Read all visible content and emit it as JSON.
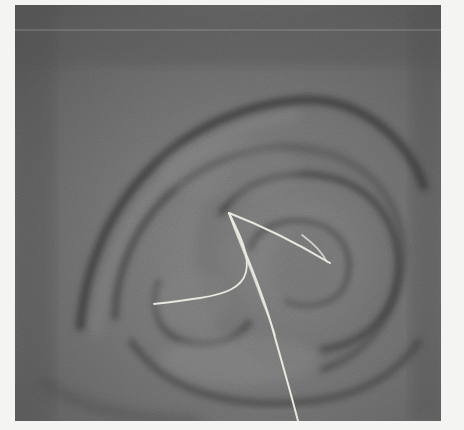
{
  "figure": {
    "colors": {
      "background": "#f4f4f2",
      "tissue_base": "#707070",
      "tissue_light": "#8a8a8a",
      "fold_shadow": "#3e3e3e",
      "path_color": "#e6e6dc"
    },
    "paths": [
      {
        "name": "main-down",
        "points": [
          [
            229,
            213
          ],
          [
            245,
            250
          ],
          [
            262,
            290
          ],
          [
            275,
            330
          ],
          [
            288,
            380
          ],
          [
            298,
            421
          ]
        ]
      },
      {
        "name": "upper-right",
        "points": [
          [
            229,
            213
          ],
          [
            270,
            232
          ],
          [
            305,
            248
          ],
          [
            330,
            263
          ]
        ]
      },
      {
        "name": "right-branch",
        "points": [
          [
            300,
            234
          ],
          [
            315,
            245
          ],
          [
            327,
            262
          ]
        ]
      },
      {
        "name": "lower-left",
        "points": [
          [
            229,
            213
          ],
          [
            240,
            235
          ],
          [
            247,
            262
          ],
          [
            240,
            285
          ],
          [
            200,
            297
          ],
          [
            154,
            304
          ]
        ]
      },
      {
        "name": "mid-down",
        "points": [
          [
            229,
            213
          ],
          [
            238,
            240
          ],
          [
            252,
            270
          ],
          [
            262,
            300
          ]
        ]
      }
    ]
  }
}
